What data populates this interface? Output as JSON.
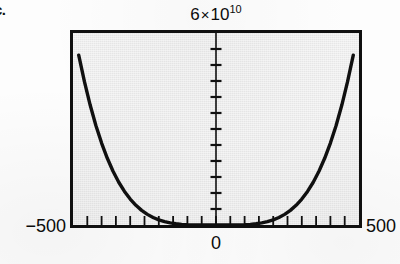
{
  "figure": {
    "item_label": "c.",
    "title_mantissa": "6",
    "title_times": "×",
    "title_base": "10",
    "title_exponent": "10",
    "title_text": "6 × 10^10",
    "x_min_label": "−500",
    "x_max_label": "500",
    "x_zero_label": "0",
    "frame_color": "#101010",
    "panel_color": "#e7e7e7",
    "curve_color": "#101010",
    "page_color": "#fdfdfd"
  },
  "chart_data": {
    "type": "line",
    "title": "6 × 10^10",
    "xlabel": "",
    "ylabel": "",
    "xlim": [
      -500,
      500
    ],
    "ylim": [
      0,
      60000000000
    ],
    "grid": false,
    "legend": null,
    "x_ticks": [
      -500,
      -450,
      -400,
      -350,
      -300,
      -250,
      -200,
      -150,
      -100,
      -50,
      0,
      50,
      100,
      150,
      200,
      250,
      300,
      350,
      400,
      450,
      500
    ],
    "x_tick_labels": [
      "−500",
      "",
      "",
      "",
      "",
      "",
      "",
      "",
      "",
      "",
      "0",
      "",
      "",
      "",
      "",
      "",
      "",
      "",
      "",
      "",
      "500"
    ],
    "y_ticks": [
      0,
      5000000000,
      10000000000,
      15000000000,
      20000000000,
      25000000000,
      30000000000,
      35000000000,
      40000000000,
      45000000000,
      50000000000,
      55000000000,
      60000000000
    ],
    "y_tick_labels": [
      "",
      "",
      "",
      "",
      "",
      "",
      "",
      "",
      "",
      "",
      "",
      "",
      "6 × 10^10"
    ],
    "series": [
      {
        "name": "y = x^4",
        "note": "even, symmetric about x = 0, flat minimum at origin, reaches 6×10^10 near the frame corners",
        "x": [
          -500,
          -480,
          -460,
          -440,
          -420,
          -400,
          -380,
          -360,
          -340,
          -320,
          -300,
          -280,
          -260,
          -240,
          -220,
          -200,
          -180,
          -160,
          -140,
          -120,
          -100,
          -80,
          -60,
          -40,
          -20,
          0,
          20,
          40,
          60,
          80,
          100,
          120,
          140,
          160,
          180,
          200,
          220,
          240,
          260,
          280,
          300,
          320,
          340,
          360,
          380,
          400,
          420,
          440,
          460,
          480,
          500
        ],
        "y": [
          62500000000,
          53084160000,
          44774560000,
          37480960000,
          31116960000,
          25600000000,
          20851360000,
          16796160000,
          13363360000,
          10485760000,
          8100000000,
          6146560000,
          4569760000,
          3317760000,
          2342560000,
          1600000000,
          1049760000,
          655360000,
          384160000,
          207360000,
          100000000,
          40960000,
          12960000,
          2560000,
          160000,
          0,
          160000,
          2560000,
          12960000,
          40960000,
          100000000,
          207360000,
          384160000,
          655360000,
          1049760000,
          1600000000,
          2342560000,
          3317760000,
          4569760000,
          6146560000,
          8100000000,
          10485760000,
          13363360000,
          16796160000,
          20851360000,
          25600000000,
          31116960000,
          37480960000,
          44774560000,
          53084160000,
          62500000000
        ]
      }
    ]
  }
}
